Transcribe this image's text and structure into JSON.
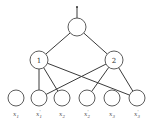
{
  "diagram": {
    "type": "tree-network",
    "input": {
      "x": 77,
      "y": 7
    },
    "root": {
      "id": "root",
      "label": "",
      "cx": 77,
      "cy": 27,
      "r": 9
    },
    "hidden": [
      {
        "id": "h1",
        "label": "1",
        "cx": 39,
        "cy": 60,
        "r": 9
      },
      {
        "id": "h2",
        "label": "2",
        "cx": 114,
        "cy": 60,
        "r": 9
      }
    ],
    "leaves": [
      {
        "id": "x1",
        "base": "x",
        "sub": "1",
        "prime": "",
        "cx": 16,
        "cy": 98,
        "r": 8
      },
      {
        "id": "x1p",
        "base": "x",
        "sub": "1",
        "prime": "'",
        "cx": 39,
        "cy": 98,
        "r": 8
      },
      {
        "id": "x2",
        "base": "x",
        "sub": "2",
        "prime": "",
        "cx": 62,
        "cy": 98,
        "r": 8
      },
      {
        "id": "x2p",
        "base": "x",
        "sub": "2",
        "prime": "'",
        "cx": 87,
        "cy": 98,
        "r": 8
      },
      {
        "id": "x3",
        "base": "x",
        "sub": "3",
        "prime": "",
        "cx": 112,
        "cy": 98,
        "r": 8
      },
      {
        "id": "x3p",
        "base": "x",
        "sub": "3",
        "prime": "'",
        "cx": 137,
        "cy": 98,
        "r": 8
      }
    ],
    "edges": [
      [
        "input",
        "root"
      ],
      [
        "root",
        "h1"
      ],
      [
        "root",
        "h2"
      ],
      [
        "h1",
        "x1p"
      ],
      [
        "h1",
        "x2"
      ],
      [
        "h1",
        "x3p"
      ],
      [
        "h2",
        "x1p"
      ],
      [
        "h2",
        "x2p"
      ],
      [
        "h2",
        "x3p"
      ]
    ],
    "colors": {
      "stroke": "#3a3a3a",
      "background": "#ffffff"
    }
  }
}
